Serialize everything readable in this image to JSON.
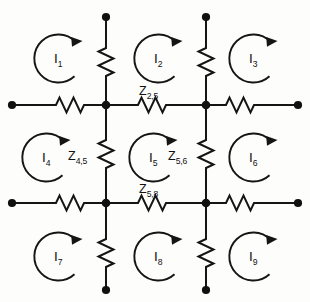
{
  "figure": {
    "name": "mesh-network-circuit",
    "type": "electrical circuit schematic",
    "ink_color": "#151515",
    "background_color": "#fdfdfc"
  },
  "mesh_currents": [
    {
      "id": "I1",
      "base": "I",
      "sub": "1",
      "direction": "clockwise"
    },
    {
      "id": "I2",
      "base": "I",
      "sub": "2",
      "direction": "clockwise"
    },
    {
      "id": "I3",
      "base": "I",
      "sub": "3",
      "direction": "clockwise"
    },
    {
      "id": "I4",
      "base": "I",
      "sub": "4",
      "direction": "clockwise"
    },
    {
      "id": "I5",
      "base": "I",
      "sub": "5",
      "direction": "clockwise"
    },
    {
      "id": "I6",
      "base": "I",
      "sub": "6",
      "direction": "clockwise"
    },
    {
      "id": "I7",
      "base": "I",
      "sub": "7",
      "direction": "clockwise"
    },
    {
      "id": "I8",
      "base": "I",
      "sub": "8",
      "direction": "clockwise"
    },
    {
      "id": "I9",
      "base": "I",
      "sub": "9",
      "direction": "clockwise"
    }
  ],
  "impedances": [
    {
      "id": "Z25",
      "base": "Z",
      "sub": "2,5",
      "branch": "upper-middle-horizontal"
    },
    {
      "id": "Z45",
      "base": "Z",
      "sub": "4,5",
      "branch": "left-middle-vertical"
    },
    {
      "id": "Z56",
      "base": "Z",
      "sub": "5,6",
      "branch": "right-middle-vertical"
    },
    {
      "id": "Z58",
      "base": "Z",
      "sub": "5,8",
      "branch": "lower-middle-horizontal"
    }
  ]
}
